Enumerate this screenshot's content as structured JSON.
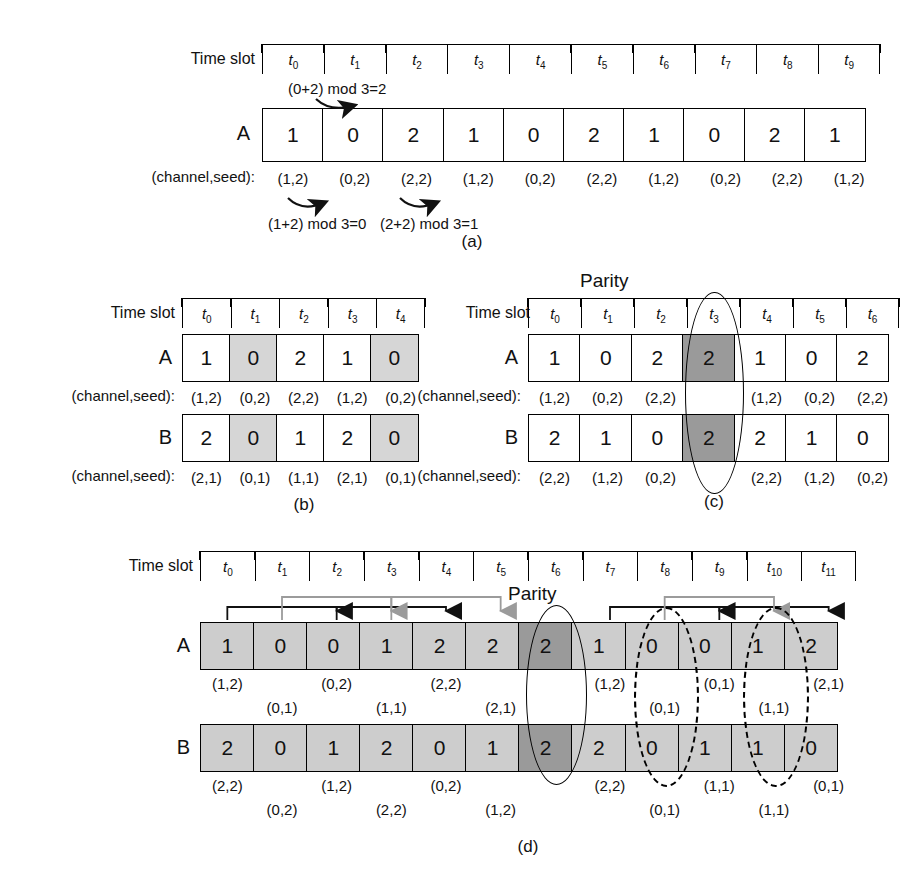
{
  "figure": {
    "labels": {
      "time_slot": "Time slot",
      "channel_seed": "(channel,seed):",
      "parity": "Parity",
      "row_a": "A",
      "row_b": "B"
    },
    "captions": {
      "a": "(a)",
      "b": "(b)",
      "c": "(c)",
      "d": "(d)"
    }
  },
  "panel_a": {
    "caption": "(a)",
    "ticks": [
      "t₀",
      "t₁",
      "t₂",
      "t₃",
      "t₄",
      "t₅",
      "t₆",
      "t₇",
      "t₈",
      "t₉"
    ],
    "tick_subs": [
      "0",
      "1",
      "2",
      "3",
      "4",
      "5",
      "6",
      "7",
      "8",
      "9"
    ],
    "row_label": "A",
    "values": [
      "1",
      "0",
      "2",
      "1",
      "0",
      "2",
      "1",
      "0",
      "2",
      "1"
    ],
    "seed_label": "(channel,seed):",
    "seeds": [
      "(1,2)",
      "(0,2)",
      "(2,2)",
      "(1,2)",
      "(0,2)",
      "(2,2)",
      "(1,2)",
      "(0,2)",
      "(2,2)",
      "(1,2)"
    ],
    "annotations": {
      "top": "(0+2) mod 3=2",
      "bottom_left": "(1+2) mod 3=0",
      "bottom_right": "(2+2) mod 3=1"
    }
  },
  "panel_b": {
    "caption": "(b)",
    "ticks": [
      "t₀",
      "t₁",
      "t₂",
      "t₃",
      "t₄"
    ],
    "tick_subs": [
      "0",
      "1",
      "2",
      "3",
      "4"
    ],
    "rows": [
      {
        "label": "A",
        "values": [
          "1",
          "0",
          "2",
          "1",
          "0"
        ],
        "shaded": [
          false,
          true,
          false,
          false,
          true
        ],
        "seed_label": "(channel,seed):",
        "seeds": [
          "(1,2)",
          "(0,2)",
          "(2,2)",
          "(1,2)",
          "(0,2)"
        ]
      },
      {
        "label": "B",
        "values": [
          "2",
          "0",
          "1",
          "2",
          "0"
        ],
        "shaded": [
          false,
          true,
          false,
          false,
          true
        ],
        "seed_label": "(channel,seed):",
        "seeds": [
          "(2,1)",
          "(0,1)",
          "(1,1)",
          "(2,1)",
          "(0,1)"
        ]
      }
    ]
  },
  "panel_c": {
    "caption": "(c)",
    "parity": "Parity",
    "parity_index": 3,
    "ticks": [
      "t₀",
      "t₁",
      "t₂",
      "t₃",
      "t₄",
      "t₅",
      "t₆"
    ],
    "tick_subs": [
      "0",
      "1",
      "2",
      "3",
      "4",
      "5",
      "6"
    ],
    "rows": [
      {
        "label": "A",
        "values": [
          "1",
          "0",
          "2",
          "2",
          "1",
          "0",
          "2"
        ],
        "dark": [
          false,
          false,
          false,
          true,
          false,
          false,
          false
        ],
        "seed_label": "(channel,seed):",
        "seeds": [
          "(1,2)",
          "(0,2)",
          "(2,2)",
          "",
          "(1,2)",
          "(0,2)",
          "(2,2)"
        ]
      },
      {
        "label": "B",
        "values": [
          "2",
          "1",
          "0",
          "2",
          "2",
          "1",
          "0"
        ],
        "dark": [
          false,
          false,
          false,
          true,
          false,
          false,
          false
        ],
        "seed_label": "(channel,seed):",
        "seeds": [
          "(2,2)",
          "(1,2)",
          "(0,2)",
          "",
          "(2,2)",
          "(1,2)",
          "(0,2)"
        ]
      }
    ]
  },
  "panel_d": {
    "caption": "(d)",
    "parity": "Parity",
    "parity_index": 6,
    "ticks": [
      "t₀",
      "t₁",
      "t₂",
      "t₃",
      "t₄",
      "t₅",
      "t₆",
      "t₇",
      "t₈",
      "t₉",
      "t₁₀",
      "t₁₁"
    ],
    "tick_subs": [
      "0",
      "1",
      "2",
      "3",
      "4",
      "5",
      "6",
      "7",
      "8",
      "9",
      "10",
      "11"
    ],
    "rows": [
      {
        "label": "A",
        "values": [
          "1",
          "0",
          "0",
          "1",
          "2",
          "2",
          "2",
          "1",
          "0",
          "0",
          "1",
          "2"
        ],
        "dark": [
          false,
          false,
          false,
          false,
          false,
          false,
          true,
          false,
          false,
          false,
          false,
          false
        ],
        "seeds_upper": [
          "(1,2)",
          "",
          "(0,2)",
          "",
          "(2,2)",
          "",
          "",
          "(1,2)",
          "",
          "(0,1)",
          "",
          "(2,1)"
        ],
        "seeds_lower": [
          "",
          "(0,1)",
          "",
          "(1,1)",
          "",
          "(2,1)",
          "",
          "",
          "(0,1)",
          "",
          "(1,1)",
          ""
        ]
      },
      {
        "label": "B",
        "values": [
          "2",
          "0",
          "1",
          "2",
          "0",
          "1",
          "2",
          "2",
          "0",
          "1",
          "1",
          "0"
        ],
        "dark": [
          false,
          false,
          false,
          false,
          false,
          false,
          true,
          false,
          false,
          false,
          false,
          false
        ],
        "seeds_upper": [
          "(2,2)",
          "",
          "(1,2)",
          "",
          "(0,2)",
          "",
          "",
          "(2,2)",
          "",
          "(1,1)",
          "",
          "(0,1)"
        ],
        "seeds_lower": [
          "",
          "(0,2)",
          "",
          "(2,2)",
          "",
          "(1,2)",
          "",
          "",
          "(0,1)",
          "",
          "(1,1)",
          ""
        ]
      }
    ],
    "dashed_ellipse_indices": [
      8,
      10
    ],
    "arrows_black": [
      [
        0,
        2
      ],
      [
        2,
        4
      ],
      [
        7,
        9
      ],
      [
        9,
        11
      ]
    ],
    "arrows_gray": [
      [
        1,
        3
      ],
      [
        3,
        5
      ],
      [
        8,
        10
      ]
    ]
  },
  "colors": {
    "line": "#000000",
    "shade_light": "#d6d6d6",
    "shade_mid": "#cdcdcd",
    "shade_dark": "#9a9a9a",
    "arrow_black": "#111111",
    "arrow_gray": "#9b9b9b",
    "background": "#ffffff"
  }
}
